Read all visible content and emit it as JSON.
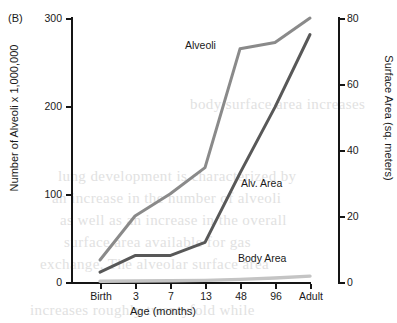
{
  "figure": {
    "panel_label": "(B)",
    "x_axis_title": "Age (months)",
    "y_axis_left_title": "Number of Alveoli x 1,000,000",
    "y_axis_right_title": "Surface Area (sq. meters)",
    "x_tick_labels": [
      "Birth",
      "3",
      "7",
      "13",
      "48",
      "96",
      "Adult"
    ],
    "y_left_tick_labels": [
      "0",
      "100",
      "200",
      "300"
    ],
    "y_right_tick_labels": [
      "0",
      "20",
      "40",
      "60",
      "80"
    ],
    "series_labels": {
      "alveoli": "Alveoli",
      "alv_area": "Alv. Area",
      "body_area": "Body Area"
    },
    "colors": {
      "alveoli": "#8a8a8a",
      "alv_area": "#585858",
      "body_area": "#c4c4c4",
      "axis": "#151515",
      "text": "#1a1a1a"
    },
    "bleed_text": [
      "lung development is characterized by",
      "an increase in the number of alveoli",
      "as well as an increase in the overall",
      "surface area available for gas",
      "exchange. The alveolar surface area",
      "increases roughly twentyfold while",
      "body surface area increases"
    ]
  },
  "chart_data": {
    "type": "line",
    "title": "",
    "subtitle": "",
    "xlabel": "Age (months)",
    "ylabel": "Number of Alveoli x 1,000,000",
    "y2label": "Surface Area (sq. meters)",
    "categories": [
      "Birth",
      "3",
      "7",
      "13",
      "48",
      "96",
      "Adult"
    ],
    "ylim": [
      0,
      300
    ],
    "y2lim": [
      0,
      80
    ],
    "yticks": [
      0,
      100,
      200,
      300
    ],
    "y2ticks": [
      0,
      20,
      40,
      60,
      80
    ],
    "grid": false,
    "legend": "inline-labels",
    "series": [
      {
        "name": "Alveoli",
        "axis": "left",
        "unit": "millions of alveoli",
        "color": "#8a8a8a",
        "values": [
          25,
          75,
          100,
          130,
          265,
          272,
          300
        ]
      },
      {
        "name": "Alv. Area",
        "axis": "right",
        "unit": "sq. meters",
        "color": "#585858",
        "values": [
          3,
          8,
          8,
          12,
          33,
          53,
          75
        ]
      },
      {
        "name": "Body Area",
        "axis": "right",
        "unit": "sq. meters",
        "color": "#c4c4c4",
        "values": [
          0.2,
          0.3,
          0.4,
          0.5,
          0.8,
          1.2,
          1.8
        ]
      }
    ]
  }
}
